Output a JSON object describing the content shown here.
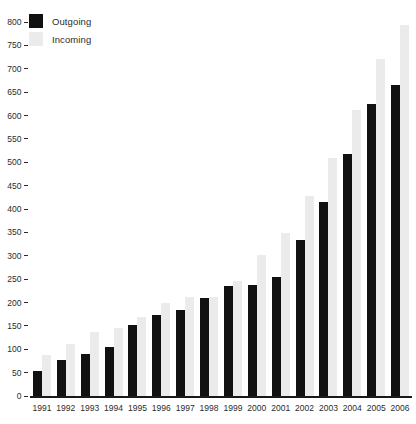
{
  "chart_data": {
    "type": "bar",
    "title": "",
    "subtitle": "",
    "xlabel": "",
    "ylabel": "",
    "categories": [
      "1991",
      "1992",
      "1993",
      "1994",
      "1995",
      "1996",
      "1997",
      "1998",
      "1999",
      "2000",
      "2001",
      "2002",
      "2003",
      "2004",
      "2005",
      "2006"
    ],
    "series": [
      {
        "name": "Outgoing",
        "color": "#111111",
        "values": [
          53,
          78,
          89,
          105,
          152,
          174,
          185,
          210,
          236,
          238,
          255,
          333,
          415,
          518,
          625,
          665
        ]
      },
      {
        "name": "Incoming",
        "color": "#ebebeb",
        "values": [
          88,
          112,
          138,
          145,
          168,
          200,
          212,
          212,
          246,
          302,
          348,
          427,
          510,
          612,
          720,
          794
        ]
      }
    ],
    "ylim": [
      0,
      800
    ],
    "ytick_step": 50,
    "yticks": [
      0,
      50,
      100,
      150,
      200,
      250,
      300,
      350,
      400,
      450,
      500,
      550,
      600,
      650,
      700,
      750,
      800
    ],
    "ytick_labels": [
      "0",
      "50",
      "100",
      "150",
      "200",
      "250",
      "300",
      "350",
      "400",
      "450",
      "500",
      "550",
      "600",
      "650",
      "700",
      "750",
      "800"
    ],
    "grid": false,
    "legend_position": "top-left",
    "legend": [
      {
        "label": "Outgoing",
        "swatch": "#111111"
      },
      {
        "label": "Incoming",
        "swatch": "#ebebeb"
      }
    ]
  }
}
